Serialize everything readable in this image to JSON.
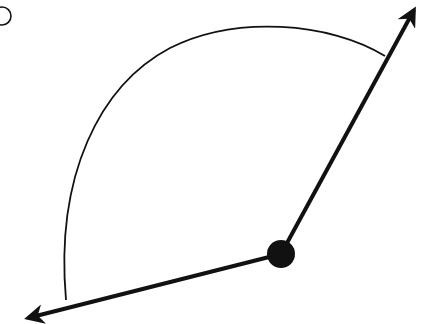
{
  "diagram": {
    "type": "angle",
    "colors": {
      "stroke": "#111111",
      "background": "#ffffff"
    },
    "vertex": {
      "x": 281,
      "y": 254
    },
    "rays": [
      {
        "name": "upper-right-ray",
        "end": {
          "x": 418,
          "y": 4
        }
      },
      {
        "name": "lower-left-ray",
        "end": {
          "x": 22,
          "y": 320
        }
      }
    ],
    "arc": {
      "start": {
        "x": 385,
        "y": 56
      },
      "end": {
        "x": 66,
        "y": 300
      }
    },
    "label_circle": {
      "cx": 2,
      "cy": 16,
      "r": 9,
      "text": ""
    }
  }
}
